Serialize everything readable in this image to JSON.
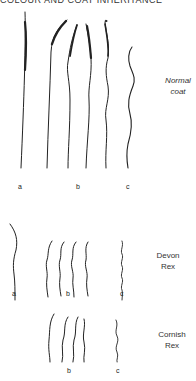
{
  "header": {
    "title": "COLOUR AND COAT INHERITANCE"
  },
  "sections": [
    {
      "name": "Normal coat",
      "line1": "Normal",
      "line2": "coat",
      "labels": [
        "a",
        "b",
        "c"
      ]
    },
    {
      "name": "Devon Rex",
      "line1": "Devon",
      "line2": "Rex",
      "labels": [
        "a",
        "b",
        "c"
      ]
    },
    {
      "name": "Cornish Rex",
      "line1": "Cornish",
      "line2": "Rex",
      "labels": [
        "b",
        "c"
      ]
    }
  ],
  "colors": {
    "ink": "#222222",
    "background": "#ffffff"
  }
}
